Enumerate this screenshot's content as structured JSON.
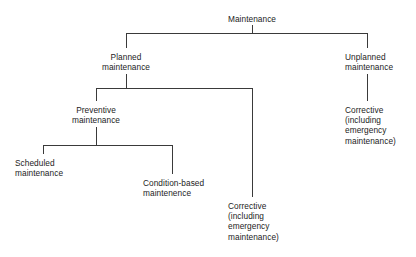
{
  "diagram": {
    "title": "Maintenance",
    "type": "hierarchy-tree",
    "background_color": "#ffffff",
    "line_color": "#3a3a3a",
    "text_color": "#1c1c1c",
    "nodes": [
      {
        "id": "maintenance",
        "label": "Maintenance",
        "level": 0,
        "x": 252,
        "y": 14,
        "align": "center"
      },
      {
        "id": "planned-maintenance",
        "label": "Planned\nmaintenance",
        "level": 1,
        "x": 126,
        "y": 52,
        "align": "center"
      },
      {
        "id": "unplanned-maintenance",
        "label": "Unplanned\nmaintenance",
        "level": 1,
        "x": 367,
        "y": 52,
        "align": "left"
      },
      {
        "id": "preventive-maintenance",
        "label": "Preventive\nmaintenance",
        "level": 2,
        "x": 96,
        "y": 105,
        "align": "center"
      },
      {
        "id": "corrective-unplanned",
        "label": "Corrective\n(including\nemergency\nmaintenance)",
        "level": 2,
        "x": 367,
        "y": 105,
        "align": "left"
      },
      {
        "id": "scheduled-maintenance",
        "label": "Scheduled\nmaintenance",
        "level": 3,
        "x": 43,
        "y": 158,
        "align": "left"
      },
      {
        "id": "condition-based-maintenance",
        "label": "Condition-based\nmaintenence",
        "level": 3,
        "x": 143,
        "y": 178,
        "align": "left"
      },
      {
        "id": "corrective-planned",
        "label": "Corrective\n(including\nemergency\nmaintenance)",
        "level": 2,
        "x": 228,
        "y": 201,
        "align": "left"
      }
    ],
    "connectors": [
      {
        "id": "root-to-level1",
        "from": "maintenance",
        "to": [
          "planned-maintenance",
          "unplanned-maintenance"
        ],
        "stem_x": 252,
        "stem_top_y": 25,
        "bar_y": 33,
        "bar_left_x": 126,
        "bar_right_x": 367,
        "drop_bottom_y": 48
      },
      {
        "id": "planned-to-children",
        "from": "planned-maintenance",
        "to": [
          "preventive-maintenance",
          "corrective-planned"
        ],
        "stem_x": 126,
        "stem_top_y": 74,
        "bar_y": 88,
        "bar_left_x": 96,
        "bar_right_x": 252,
        "drop_left_bottom_y": 101,
        "drop_right_bottom_y": 197
      },
      {
        "id": "preventive-to-children",
        "from": "preventive-maintenance",
        "to": [
          "scheduled-maintenance",
          "condition-based-maintenance"
        ],
        "stem_x": 96,
        "stem_top_y": 127,
        "bar_y": 145,
        "bar_left_x": 43,
        "bar_right_x": 172,
        "drop_left_bottom_y": 154,
        "drop_right_bottom_y": 174
      },
      {
        "id": "unplanned-to-corrective",
        "from": "unplanned-maintenance",
        "to": [
          "corrective-unplanned"
        ],
        "stem_x": 367,
        "stem_top_y": 74,
        "stem_bottom_y": 101
      }
    ]
  }
}
